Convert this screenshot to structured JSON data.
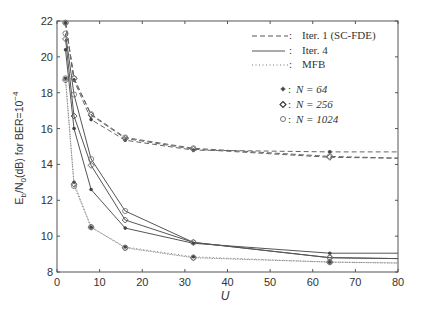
{
  "chart_data": {
    "type": "line",
    "title": "",
    "xlabel": "U",
    "ylabel": "E_b/N_0(dB) for BER=10^-4",
    "xlim": [
      0,
      80
    ],
    "ylim": [
      8,
      22
    ],
    "xticks": [
      0,
      10,
      20,
      30,
      40,
      50,
      60,
      70,
      80
    ],
    "yticks": [
      8,
      10,
      12,
      14,
      16,
      18,
      20,
      22
    ],
    "grid": false,
    "legend_position": "upper right",
    "legend": {
      "line_styles": [
        {
          "style": "dashed",
          "label": "Iter. 1 (SC-FDE)"
        },
        {
          "style": "solid",
          "label": "Iter. 4"
        },
        {
          "style": "dotted",
          "label": "MFB"
        }
      ],
      "markers": [
        {
          "marker": "star",
          "symbol": "∗",
          "label": "N = 64"
        },
        {
          "marker": "diamond",
          "symbol": "◇",
          "label": "N = 256"
        },
        {
          "marker": "circle",
          "symbol": "○",
          "label": "N = 1024"
        }
      ]
    },
    "x": [
      2,
      4,
      8,
      16,
      32,
      64,
      80
    ],
    "series": [
      {
        "name": "Iter. 1 (SC-FDE), N = 64",
        "style": "dashed",
        "marker": "star",
        "values": [
          21.9,
          18.7,
          16.5,
          15.35,
          14.8,
          14.7,
          14.7
        ]
      },
      {
        "name": "Iter. 1 (SC-FDE), N = 256",
        "style": "dashed",
        "marker": "diamond",
        "values": [
          21.9,
          18.8,
          16.75,
          15.45,
          14.85,
          14.4,
          14.35
        ]
      },
      {
        "name": "Iter. 1 (SC-FDE), N = 1024",
        "style": "dashed",
        "marker": "circle",
        "values": [
          21.9,
          18.8,
          16.8,
          15.5,
          14.9,
          14.45,
          14.35
        ]
      },
      {
        "name": "Iter. 4, N = 64",
        "style": "solid",
        "marker": "star",
        "values": [
          20.4,
          16.0,
          12.6,
          10.45,
          9.6,
          9.05,
          9.05
        ]
      },
      {
        "name": "Iter. 4, N = 256",
        "style": "solid",
        "marker": "diamond",
        "values": [
          21.0,
          16.7,
          13.95,
          10.9,
          9.65,
          8.8,
          8.75
        ]
      },
      {
        "name": "Iter. 4, N = 1024",
        "style": "solid",
        "marker": "circle",
        "values": [
          21.3,
          17.9,
          14.3,
          11.4,
          9.65,
          8.8,
          8.75
        ]
      },
      {
        "name": "MFB, N = 64",
        "style": "dotted",
        "marker": "star",
        "values": [
          18.8,
          13.0,
          10.5,
          9.4,
          8.85,
          8.55,
          8.5
        ]
      },
      {
        "name": "MFB, N = 256",
        "style": "dotted",
        "marker": "diamond",
        "values": [
          18.7,
          12.9,
          10.5,
          9.35,
          8.8,
          8.55,
          8.5
        ]
      },
      {
        "name": "MFB, N = 1024",
        "style": "dotted",
        "marker": "circle",
        "values": [
          18.8,
          12.8,
          10.5,
          9.35,
          8.8,
          8.55,
          8.5
        ]
      }
    ]
  },
  "labels": {
    "xlabel": "U",
    "ylabel_main": "E",
    "ylabel_sub_b": "b",
    "ylabel_mid": "/N",
    "ylabel_sub_0": "0",
    "ylabel_tail": "(dB) for BER=10",
    "ylabel_exp": "−4",
    "legend_dashed": "Iter. 1 (SC-FDE)",
    "legend_solid": "Iter. 4",
    "legend_dotted": "MFB",
    "legend_n64": "N = 64",
    "legend_n256": "N = 256",
    "legend_n1024": "N = 1024",
    "colon": ":"
  }
}
